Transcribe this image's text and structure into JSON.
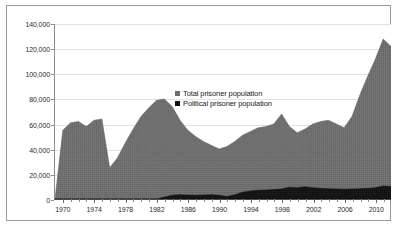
{
  "chart_data": {
    "type": "area",
    "title": "",
    "subtitle": "",
    "xlabel": "",
    "ylabel": "",
    "xlim": [
      1969,
      2012
    ],
    "ylim": [
      0,
      140000
    ],
    "grid": true,
    "legend_position": "inside-center",
    "y_ticks": [
      "0",
      "20,000",
      "40,000",
      "60,000",
      "80,000",
      "100,000",
      "120,000",
      "140,000"
    ],
    "y_tick_values": [
      0,
      20000,
      40000,
      60000,
      80000,
      100000,
      120000,
      140000
    ],
    "x_ticks": [
      "1970",
      "1974",
      "1978",
      "1982",
      "1986",
      "1990",
      "1994",
      "1998",
      "2002",
      "2006",
      "2010"
    ],
    "x_tick_values": [
      1970,
      1974,
      1978,
      1982,
      1986,
      1990,
      1994,
      1998,
      2002,
      2006,
      2010
    ],
    "colors": {
      "total": "#6e6e6e",
      "political": "#121212",
      "gridline": "#e2e2e2",
      "axis": "#5a5a5a",
      "frame": "#9a9a9a",
      "background": "#ffffff"
    },
    "series": [
      {
        "name": "Total prisoner population",
        "color": "#6e6e6e",
        "x": [
          1969,
          1970,
          1971,
          1972,
          1973,
          1974,
          1975,
          1976,
          1977,
          1978,
          1979,
          1980,
          1981,
          1982,
          1983,
          1984,
          1985,
          1986,
          1987,
          1988,
          1989,
          1990,
          1991,
          1992,
          1993,
          1994,
          1995,
          1996,
          1997,
          1998,
          1999,
          2000,
          2001,
          2002,
          2003,
          2004,
          2005,
          2006,
          2007,
          2008,
          2009,
          2010,
          2011,
          2012
        ],
        "values": [
          0,
          55000,
          61000,
          62000,
          58000,
          63000,
          64000,
          25000,
          33000,
          45000,
          56000,
          66000,
          73000,
          79000,
          80000,
          74000,
          63000,
          55000,
          50000,
          46000,
          43000,
          40000,
          42000,
          46000,
          51000,
          54000,
          57000,
          58000,
          60000,
          68000,
          58000,
          53000,
          56000,
          60000,
          62000,
          63000,
          60000,
          57000,
          66000,
          83000,
          98000,
          112000,
          128000,
          122000
        ]
      },
      {
        "name": "Political prisoner population",
        "color": "#121212",
        "x": [
          1969,
          1970,
          1971,
          1972,
          1973,
          1974,
          1975,
          1976,
          1977,
          1978,
          1979,
          1980,
          1981,
          1982,
          1983,
          1984,
          1985,
          1986,
          1987,
          1988,
          1989,
          1990,
          1991,
          1992,
          1993,
          1994,
          1995,
          1996,
          1997,
          1998,
          1999,
          2000,
          2001,
          2002,
          2003,
          2004,
          2005,
          2006,
          2007,
          2008,
          2009,
          2010,
          2011,
          2012
        ],
        "values": [
          0,
          0,
          0,
          0,
          0,
          0,
          0,
          0,
          0,
          0,
          0,
          0,
          0,
          0,
          1500,
          3000,
          3500,
          3200,
          3000,
          3200,
          3500,
          3000,
          2000,
          3500,
          5500,
          6500,
          7000,
          7200,
          7500,
          8000,
          9500,
          9000,
          9800,
          9000,
          8500,
          8200,
          8000,
          7800,
          8000,
          8200,
          8500,
          9000,
          10500,
          10000
        ]
      }
    ],
    "legend": [
      {
        "label": "Total prisoner population",
        "color": "#6e6e6e"
      },
      {
        "label": "Political prisoner population",
        "color": "#121212"
      }
    ]
  }
}
